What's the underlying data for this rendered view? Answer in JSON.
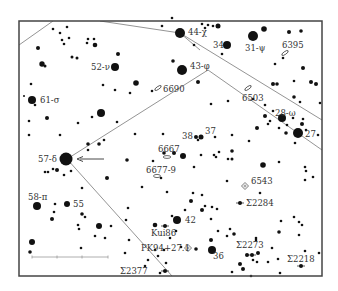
{
  "chart_data": {
    "type": "star-chart",
    "frame": {
      "x": 19,
      "y": 21,
      "width": 303,
      "height": 255
    },
    "colors": {
      "stars": "#111111",
      "lines": "#888888",
      "frame": "#444444",
      "text": "#333333",
      "background": "#ffffff"
    },
    "boundary_lines": [
      [
        [
          19,
          45
        ],
        [
          53,
          21
        ]
      ],
      [
        [
          100,
          21
        ],
        [
          180,
          33
        ],
        [
          322,
          120
        ]
      ],
      [
        [
          180,
          33
        ],
        [
          200,
          50
        ]
      ],
      [
        [
          208,
          70
        ],
        [
          322,
          150
        ]
      ],
      [
        [
          208,
          70
        ],
        [
          67,
          159
        ],
        [
          172,
          276
        ]
      ]
    ],
    "labeled_stars": [
      {
        "name": "44-χ",
        "x": 180,
        "y": 33,
        "r": 5,
        "lx": 188,
        "ly": 35
      },
      {
        "name": "34",
        "x": 227,
        "y": 45,
        "r": 4,
        "lx": 213,
        "ly": 48
      },
      {
        "name": "31-ψ",
        "x": 253,
        "y": 36,
        "r": 5,
        "lx": 245,
        "ly": 51
      },
      {
        "name": "52-ν",
        "x": 115,
        "y": 67,
        "r": 4,
        "lx": 91,
        "ly": 70
      },
      {
        "name": "43-φ",
        "x": 182,
        "y": 70,
        "r": 5,
        "lx": 190,
        "ly": 69
      },
      {
        "name": "61-σ",
        "x": 32,
        "y": 100,
        "r": 4,
        "lx": 40,
        "ly": 103
      },
      {
        "name": "28-ω",
        "x": 282,
        "y": 118,
        "r": 4,
        "lx": 275,
        "ly": 116
      },
      {
        "name": "27",
        "x": 298,
        "y": 133,
        "r": 5,
        "lx": 305,
        "ly": 137
      },
      {
        "name": "38",
        "x": 196,
        "y": 137,
        "r": 2,
        "lx": 182,
        "ly": 139
      },
      {
        "name": "37",
        "x": 201,
        "y": 137,
        "r": 2.5,
        "lx": 205,
        "ly": 134
      },
      {
        "name": "57-δ",
        "x": 66,
        "y": 159,
        "r": 6.5,
        "lx": 38,
        "ly": 162
      },
      {
        "name": "58-π",
        "x": 37,
        "y": 206,
        "r": 4,
        "lx": 28,
        "ly": 200
      },
      {
        "name": "55",
        "x": 67,
        "y": 204,
        "r": 3,
        "lx": 73,
        "ly": 207
      },
      {
        "name": "42",
        "x": 177,
        "y": 220,
        "r": 4,
        "lx": 185,
        "ly": 223
      },
      {
        "name": "36",
        "x": 212,
        "y": 250,
        "r": 4,
        "lx": 213,
        "ly": 259
      },
      {
        "name": "Kui86",
        "x": 165,
        "y": 226,
        "r": 2,
        "lx": 151,
        "ly": 236
      },
      {
        "name": "Σ2284",
        "x": 240,
        "y": 203,
        "r": 2,
        "lx": 246,
        "ly": 206
      },
      {
        "name": "Σ2273",
        "x": 252,
        "y": 255,
        "r": 2,
        "lx": 236,
        "ly": 248
      },
      {
        "name": "Σ2218",
        "x": 301,
        "y": 266,
        "r": 2,
        "lx": 287,
        "ly": 262
      },
      {
        "name": "Σ2377",
        "x": 165,
        "y": 271,
        "r": 2,
        "lx": 120,
        "ly": 274
      }
    ],
    "deep_sky_objects": [
      {
        "name": "6395",
        "x": 285,
        "y": 53,
        "type": "galaxy",
        "lx": 282,
        "ly": 48
      },
      {
        "name": "6690",
        "x": 158,
        "y": 88,
        "type": "galaxy",
        "lx": 163,
        "ly": 92
      },
      {
        "name": "6503",
        "x": 248,
        "y": 88,
        "type": "galaxy",
        "lx": 242,
        "ly": 101
      },
      {
        "name": "6667",
        "x": 167,
        "y": 157,
        "type": "galaxy",
        "lx": 158,
        "ly": 152
      },
      {
        "name": "6677-9",
        "x": 157,
        "y": 176,
        "type": "galaxy-group",
        "lx": 146,
        "ly": 173
      },
      {
        "name": "6543",
        "x": 245,
        "y": 186,
        "type": "planetary-nebula",
        "lx": 251,
        "ly": 184
      },
      {
        "name": "PK94+27.1",
        "x": 188,
        "y": 248,
        "type": "planetary-nebula",
        "lx": 141,
        "ly": 251
      }
    ],
    "arrow": {
      "from": [
        104,
        159
      ],
      "to": [
        77,
        159
      ],
      "label": ""
    },
    "scale_bar": {
      "x1": 32,
      "x2": 108,
      "y": 257,
      "ticks": [
        32,
        57,
        82,
        108
      ]
    },
    "field_stars": [
      [
        53,
        29,
        1.3
      ],
      [
        60,
        33,
        1.3
      ],
      [
        67,
        27,
        1.3
      ],
      [
        62,
        40,
        1.3
      ],
      [
        64,
        44,
        1.3
      ],
      [
        69,
        38,
        1.3
      ],
      [
        88,
        39,
        1.3
      ],
      [
        94,
        39,
        1.3
      ],
      [
        87,
        43,
        1.3
      ],
      [
        95,
        45,
        2.3
      ],
      [
        38,
        48,
        2
      ],
      [
        42,
        64,
        2.7
      ],
      [
        45,
        66,
        1.5
      ],
      [
        72,
        57,
        1.5
      ],
      [
        77,
        58,
        1.5
      ],
      [
        118,
        54,
        2
      ],
      [
        136,
        83,
        2.8
      ],
      [
        31,
        84,
        1.3
      ],
      [
        103,
        85,
        1.3
      ],
      [
        115,
        90,
        1.3
      ],
      [
        130,
        93,
        1.3
      ],
      [
        152,
        91,
        1.3
      ],
      [
        24,
        96,
        1
      ],
      [
        35,
        105,
        1.3
      ],
      [
        29,
        121,
        1.3
      ],
      [
        47,
        118,
        2
      ],
      [
        78,
        123,
        1.3
      ],
      [
        92,
        117,
        1.3
      ],
      [
        101,
        113,
        4
      ],
      [
        117,
        122,
        1.3
      ],
      [
        29,
        135,
        1.3
      ],
      [
        60,
        135,
        1.3
      ],
      [
        135,
        134,
        1.3
      ],
      [
        163,
        134,
        1.3
      ],
      [
        45,
        172,
        1.3
      ],
      [
        53,
        169,
        1.3
      ],
      [
        57,
        170,
        2
      ],
      [
        64,
        175,
        1.3
      ],
      [
        71,
        171,
        1.3
      ],
      [
        48,
        172,
        1.3
      ],
      [
        88,
        144,
        1.8
      ],
      [
        99,
        144,
        1.8
      ],
      [
        104,
        140,
        1.3
      ],
      [
        127,
        160,
        1.8
      ],
      [
        88,
        150,
        1.3
      ],
      [
        107,
        178,
        2
      ],
      [
        82,
        188,
        1.3
      ],
      [
        55,
        204,
        1.3
      ],
      [
        54,
        212,
        1.3
      ],
      [
        52,
        219,
        2
      ],
      [
        82,
        214,
        1.8
      ],
      [
        85,
        217,
        1.3
      ],
      [
        78,
        225,
        1.3
      ],
      [
        79,
        229,
        1.3
      ],
      [
        99,
        226,
        3
      ],
      [
        111,
        226,
        1.3
      ],
      [
        95,
        236,
        1.3
      ],
      [
        105,
        238,
        1.3
      ],
      [
        32,
        242,
        3
      ],
      [
        30,
        252,
        1.8
      ],
      [
        81,
        248,
        1.3
      ],
      [
        126,
        220,
        1.3
      ],
      [
        128,
        208,
        1.3
      ],
      [
        129,
        240,
        1.3
      ],
      [
        125,
        253,
        1.3
      ],
      [
        145,
        266,
        1.3
      ],
      [
        160,
        273,
        1.3
      ],
      [
        172,
        18,
        1.3
      ],
      [
        162,
        26,
        1.3
      ],
      [
        202,
        24,
        1.3
      ],
      [
        208,
        25,
        1.3
      ],
      [
        213,
        26,
        1.3
      ],
      [
        205,
        28,
        1.3
      ],
      [
        218,
        26,
        2.5
      ],
      [
        264,
        29,
        2.8
      ],
      [
        289,
        32,
        2
      ],
      [
        301,
        31,
        1.8
      ],
      [
        194,
        45,
        1.3
      ],
      [
        222,
        54,
        1.3
      ],
      [
        173,
        61,
        1.8
      ],
      [
        198,
        82,
        2
      ],
      [
        211,
        104,
        1.3
      ],
      [
        228,
        101,
        1.3
      ],
      [
        273,
        84,
        2
      ],
      [
        277,
        84,
        1.8
      ],
      [
        294,
        81,
        1.3
      ],
      [
        300,
        102,
        1.3
      ],
      [
        294,
        97,
        1.8
      ],
      [
        253,
        99,
        1.3
      ],
      [
        275,
        64,
        1.3
      ],
      [
        283,
        58,
        1.3
      ],
      [
        303,
        68,
        2
      ],
      [
        311,
        82,
        2
      ],
      [
        316,
        84,
        2
      ],
      [
        320,
        103,
        1.3
      ],
      [
        265,
        105,
        1.3
      ],
      [
        273,
        111,
        1.3
      ],
      [
        265,
        116,
        2
      ],
      [
        268,
        124,
        1.3
      ],
      [
        270,
        121,
        1.3
      ],
      [
        303,
        119,
        1.3
      ],
      [
        293,
        118,
        1.3
      ],
      [
        302,
        124,
        2
      ],
      [
        306,
        130,
        1.3
      ],
      [
        295,
        143,
        1.3
      ],
      [
        257,
        128,
        2
      ],
      [
        279,
        128,
        1.3
      ],
      [
        287,
        125,
        1.3
      ],
      [
        286,
        133,
        1.8
      ],
      [
        318,
        135,
        1.3
      ],
      [
        164,
        153,
        1.8
      ],
      [
        174,
        153,
        2
      ],
      [
        153,
        161,
        1.3
      ],
      [
        183,
        156,
        3
      ],
      [
        201,
        155,
        1.3
      ],
      [
        194,
        167,
        1.3
      ],
      [
        198,
        140,
        1.3
      ],
      [
        215,
        137,
        1.3
      ],
      [
        214,
        155,
        1.3
      ],
      [
        216,
        157,
        1.3
      ],
      [
        202,
        195,
        1.3
      ],
      [
        193,
        193,
        1.3
      ],
      [
        205,
        206,
        1.3
      ],
      [
        228,
        159,
        1.3
      ],
      [
        232,
        159,
        1.5
      ],
      [
        232,
        135,
        1.3
      ],
      [
        249,
        141,
        1.3
      ],
      [
        232,
        151,
        1.8
      ],
      [
        263,
        165,
        2.8
      ],
      [
        279,
        162,
        1.3
      ],
      [
        305,
        167,
        1.3
      ],
      [
        306,
        171,
        1.3
      ],
      [
        313,
        177,
        1.3
      ],
      [
        305,
        180,
        1.3
      ],
      [
        219,
        152,
        1.3
      ],
      [
        227,
        181,
        1.3
      ],
      [
        260,
        193,
        1.3
      ],
      [
        161,
        178,
        1.3
      ],
      [
        142,
        187,
        1.3
      ],
      [
        167,
        192,
        1.3
      ],
      [
        191,
        201,
        2
      ],
      [
        212,
        207,
        1.3
      ],
      [
        217,
        209,
        1.3
      ],
      [
        211,
        219,
        1.3
      ],
      [
        202,
        210,
        2
      ],
      [
        185,
        210,
        1.3
      ],
      [
        230,
        229,
        1.3
      ],
      [
        234,
        234,
        1.8
      ],
      [
        256,
        238,
        1.3
      ],
      [
        281,
        221,
        1.3
      ],
      [
        279,
        232,
        1.8
      ],
      [
        294,
        217,
        1.3
      ],
      [
        299,
        222,
        1.3
      ],
      [
        302,
        225,
        1.3
      ],
      [
        299,
        235,
        1.3
      ],
      [
        256,
        240,
        1.3
      ],
      [
        247,
        255,
        2
      ],
      [
        258,
        253,
        2
      ],
      [
        253,
        260,
        1.3
      ],
      [
        257,
        262,
        1.3
      ],
      [
        240,
        264,
        2
      ],
      [
        232,
        272,
        1.3
      ],
      [
        243,
        269,
        2
      ],
      [
        251,
        276,
        1.3
      ],
      [
        272,
        248,
        1.3
      ],
      [
        268,
        262,
        1.3
      ],
      [
        278,
        259,
        1.3
      ],
      [
        305,
        251,
        1.3
      ],
      [
        211,
        240,
        2
      ],
      [
        218,
        231,
        1.3
      ],
      [
        227,
        236,
        1.3
      ],
      [
        196,
        249,
        1.8
      ],
      [
        181,
        247,
        1.3
      ],
      [
        176,
        231,
        1.3
      ],
      [
        170,
        238,
        1.3
      ],
      [
        155,
        225,
        2.3
      ],
      [
        172,
        216,
        1.3
      ],
      [
        155,
        250,
        1.3
      ],
      [
        158,
        256,
        1.3
      ],
      [
        164,
        250,
        1.3
      ],
      [
        166,
        263,
        1.3
      ],
      [
        148,
        260,
        1.3
      ],
      [
        280,
        273,
        1.3
      ],
      [
        319,
        253,
        1.3
      ]
    ]
  }
}
